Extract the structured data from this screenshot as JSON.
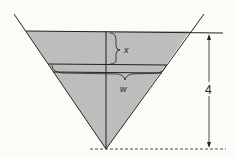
{
  "diagram": {
    "labels": {
      "x": "x",
      "w": "w",
      "height": "4"
    },
    "colors": {
      "fill": "#bdbdbb",
      "line": "#222222",
      "background": "#fbfbf8"
    }
  }
}
